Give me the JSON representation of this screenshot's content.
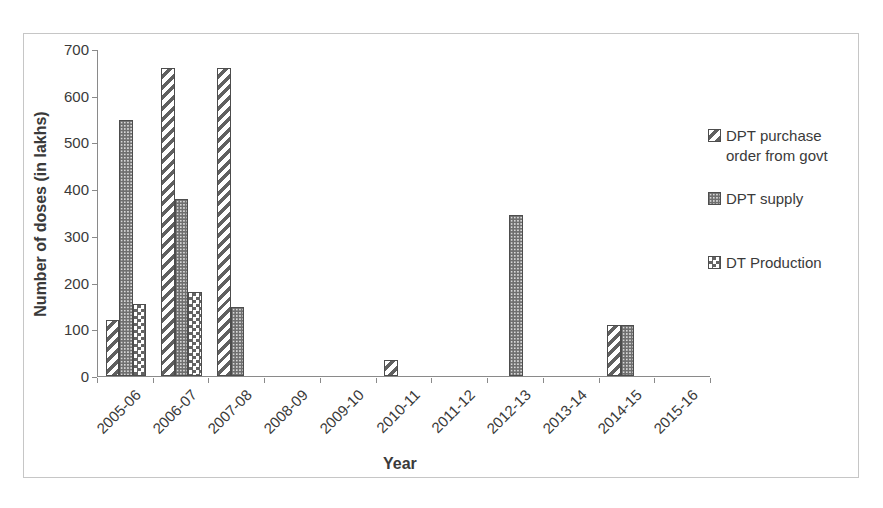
{
  "chart_data": {
    "type": "bar",
    "title": "",
    "xlabel": "Year",
    "ylabel": "Number of doses (in lakhs)",
    "ylim": [
      0,
      700
    ],
    "ytick_step": 100,
    "yticks": [
      0,
      100,
      200,
      300,
      400,
      500,
      600,
      700
    ],
    "categories": [
      "2005-06",
      "2006-07",
      "2007-08",
      "2008-09",
      "2009-10",
      "2010-11",
      "2011-12",
      "2012-13",
      "2013-14",
      "2014-15",
      "2015-16"
    ],
    "series": [
      {
        "name": "DPT purchase order from govt",
        "pattern": "diagonal-stripe",
        "values": [
          120,
          660,
          660,
          0,
          0,
          35,
          0,
          0,
          0,
          110,
          0
        ]
      },
      {
        "name": "DPT supply",
        "pattern": "dense-dots",
        "values": [
          548,
          380,
          147,
          0,
          0,
          0,
          0,
          345,
          0,
          110,
          0
        ]
      },
      {
        "name": "DT Production",
        "pattern": "checkerboard",
        "values": [
          155,
          180,
          0,
          0,
          0,
          0,
          0,
          0,
          0,
          0,
          0
        ]
      }
    ],
    "legend_position": "right",
    "grid": false
  },
  "colors": {
    "pattern_ink": "#606060",
    "bar_fill_dots": "#6f6f6f",
    "bar_outline": "#4d4d4d",
    "axis": "#8a8a8a",
    "text": "#3a3a3a",
    "frame_border": "#c6c6c6",
    "background": "#ffffff"
  }
}
